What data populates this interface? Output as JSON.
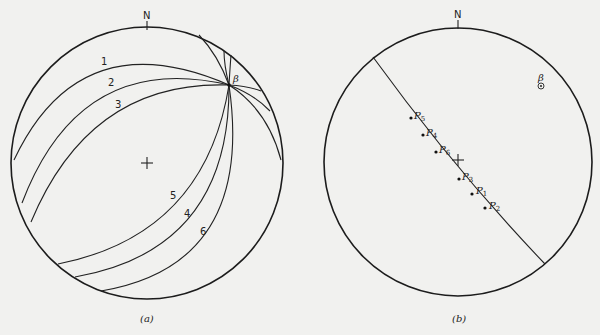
{
  "figure": {
    "left_panel": {
      "caption": "(a)",
      "north_label": "N",
      "intersection_label": "β",
      "great_circle_labels": [
        "1",
        "2",
        "3",
        "4",
        "5",
        "6"
      ]
    },
    "right_panel": {
      "caption": "(b)",
      "north_label": "N",
      "beta_label": "β",
      "pole_labels": {
        "P5": "P",
        "P5_sub": "5",
        "P4": "P",
        "P4_sub": "4",
        "P6": "P",
        "P6_sub": "6",
        "P3": "P",
        "P3_sub": "3",
        "P1": "P",
        "P1_sub": "1",
        "P2": "P",
        "P2_sub": "2"
      }
    }
  },
  "colors": {
    "background": "#f1f1ef",
    "line": "#222222"
  }
}
